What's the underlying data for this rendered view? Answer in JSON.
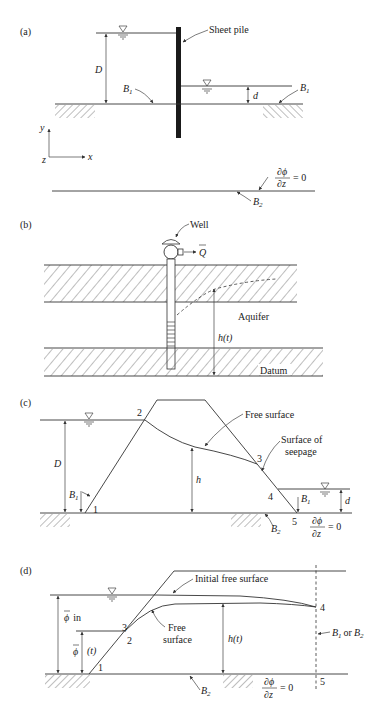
{
  "figure": {
    "panels": [
      {
        "id": "a",
        "label": "(a)",
        "annotations": {
          "sheet_pile": "Sheet pile",
          "D": "D",
          "d": "d",
          "B1_left": "B",
          "B1_right": "B",
          "sub1": "1",
          "B2": "B",
          "sub2": "2",
          "axis_y": "y",
          "axis_x": "x",
          "axis_z": "z",
          "bc_num": "∂ϕ",
          "bc_den": "∂z",
          "bc_eq": "= 0"
        }
      },
      {
        "id": "b",
        "label": "(b)",
        "annotations": {
          "well": "Well",
          "Q": "Q",
          "aquifer": "Aquifer",
          "h_t": "h(t)",
          "datum": "Datum"
        }
      },
      {
        "id": "c",
        "label": "(c)",
        "annotations": {
          "free_surface": "Free surface",
          "surface_of_seepage_1": "Surface of",
          "surface_of_seepage_2": "seepage",
          "D": "D",
          "h": "h",
          "d": "d",
          "B1_left": "B",
          "B1_right": "B",
          "sub1": "1",
          "B2": "B",
          "sub2": "2",
          "p1": "1",
          "p2": "2",
          "p3": "3",
          "p4": "4",
          "p5": "5",
          "bc_num": "∂ϕ",
          "bc_den": "∂z",
          "bc_eq": "= 0"
        }
      },
      {
        "id": "d",
        "label": "(d)",
        "annotations": {
          "initial_free_surface": "Initial free surface",
          "free_1": "Free",
          "free_2": "surface",
          "phi_in": "ϕ",
          "phi_in_sub": "in",
          "phi_t": "ϕ",
          "phi_t_arg": "(t)",
          "h_t": "h(t)",
          "B1_or_B2": "or",
          "B": "B",
          "sub1": "1",
          "sub2": "2",
          "B2": "B",
          "p1": "1",
          "p2": "2",
          "p3": "3",
          "p4": "4",
          "p5": "5",
          "bc_num": "∂ϕ",
          "bc_den": "∂z",
          "bc_eq": "= 0"
        }
      }
    ]
  }
}
